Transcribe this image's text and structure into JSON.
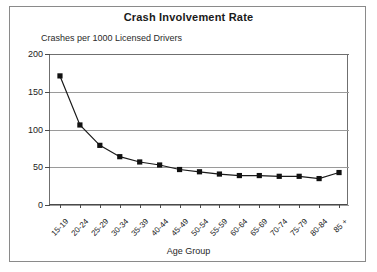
{
  "chart_data": {
    "type": "line",
    "title": "Crash Involvement Rate",
    "subtitle": "Crashes per 1000 Licensed Drivers",
    "xlabel": "Age Group",
    "ylabel": "",
    "ylim": [
      0,
      200
    ],
    "yticks": [
      0,
      50,
      100,
      150,
      200
    ],
    "grid": true,
    "legend": false,
    "marker": "square",
    "categories": [
      "15-19",
      "20-24",
      "25-29",
      "30-34",
      "35-39",
      "40-44",
      "45-49",
      "50-54",
      "55-59",
      "60-64",
      "65-69",
      "70-74",
      "75-79",
      "80-84",
      "85 +"
    ],
    "values": [
      171,
      106,
      79,
      64,
      57,
      53,
      47,
      44,
      41,
      39,
      39,
      38,
      38,
      35,
      43
    ]
  },
  "axes": {
    "y_tick_labels": [
      "200",
      "150",
      "100",
      "50",
      "0"
    ],
    "x_tick_labels": [
      "15-19",
      "20-24",
      "25-29",
      "30-34",
      "35-39",
      "40-44",
      "45-49",
      "50-54",
      "55-59",
      "60-64",
      "65-69",
      "70-74",
      "75-79",
      "80-84",
      "85 +"
    ],
    "x_axis_title": "Age Group"
  },
  "colors": {
    "line": "#1a1a1a",
    "marker": "#111111",
    "grid": "#9a9a9a",
    "axis": "#4a4a4a",
    "background": "#ffffff",
    "text": "#1a1a1a"
  }
}
